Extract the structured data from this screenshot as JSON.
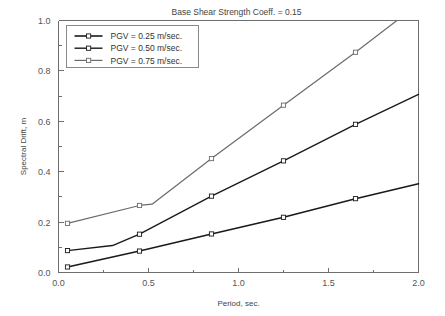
{
  "chart_data": {
    "type": "line",
    "title": "Base Shear Strength Coeff. = 0.15",
    "xlabel": "Period, sec.",
    "ylabel": "Spectral Drift, m",
    "xlim": [
      0.0,
      2.0
    ],
    "ylim": [
      0.0,
      1.0
    ],
    "xticks": [
      "0.0",
      "0.5",
      "1.0",
      "1.5",
      "2.0"
    ],
    "xtick_values": [
      0.0,
      0.5,
      1.0,
      1.5,
      2.0
    ],
    "yticks": [
      "0.0",
      "0.2",
      "0.4",
      "0.6",
      "0.8",
      "1.0"
    ],
    "ytick_values": [
      0.0,
      0.2,
      0.4,
      0.6,
      0.8,
      1.0
    ],
    "grid": false,
    "legend_position": "upper left",
    "series": [
      {
        "name": "PGV = 0.25 m/sec.",
        "color": "#1a1a1a",
        "width": 1.6,
        "marker": "square",
        "x": [
          0.05,
          0.45,
          0.85,
          1.25,
          1.65,
          2.0
        ],
        "y": [
          0.022,
          0.085,
          0.153,
          0.219,
          0.293,
          0.352
        ]
      },
      {
        "name": "PGV = 0.50 m/sec.",
        "color": "#1a1a1a",
        "width": 1.4,
        "marker": "square",
        "x": [
          0.05,
          0.3,
          0.45,
          0.85,
          1.25,
          1.65,
          2.0
        ],
        "y": [
          0.087,
          0.107,
          0.152,
          0.303,
          0.443,
          0.588,
          0.707
        ]
      },
      {
        "name": "PGV = 0.75 m/sec.",
        "color": "#6b6b6b",
        "width": 1.2,
        "marker": "square",
        "x": [
          0.05,
          0.45,
          0.52,
          0.85,
          1.25,
          1.65,
          1.88
        ],
        "y": [
          0.195,
          0.266,
          0.271,
          0.452,
          0.664,
          0.874,
          1.0
        ]
      }
    ]
  },
  "legend": {
    "entries": [
      "PGV = 0.25 m/sec.",
      "PGV = 0.50 m/sec.",
      "PGV = 0.75 m/sec."
    ]
  }
}
